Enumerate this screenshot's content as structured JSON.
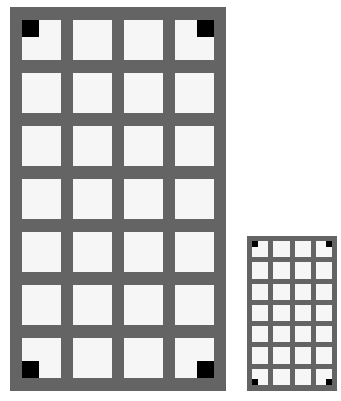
{
  "figure": {
    "colors": {
      "frame": "#646464",
      "cell": "#f6f6f6",
      "marker": "#000000",
      "background": "#ffffff"
    },
    "grids": [
      {
        "name": "large-grid",
        "rows": 7,
        "cols": 4,
        "markers": [
          "top-left",
          "top-right",
          "bottom-left",
          "bottom-right"
        ]
      },
      {
        "name": "small-grid",
        "rows": 7,
        "cols": 4,
        "markers": [
          "top-left",
          "top-right",
          "bottom-left",
          "bottom-right"
        ]
      }
    ]
  }
}
